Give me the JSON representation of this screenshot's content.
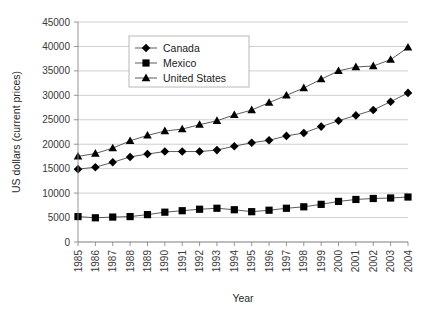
{
  "chart_data": {
    "type": "line",
    "title": "",
    "xlabel": "Year",
    "ylabel": "US dollars (current prices)",
    "x": [
      1985,
      1986,
      1987,
      1988,
      1989,
      1990,
      1991,
      1992,
      1993,
      1994,
      1995,
      1996,
      1997,
      1998,
      1999,
      2000,
      2001,
      2002,
      2003,
      2004
    ],
    "xtick_labels": [
      "1985",
      "1986",
      "1987",
      "1988",
      "1989",
      "1990",
      "1991",
      "1992",
      "1993",
      "1994",
      "1995",
      "1996",
      "1997",
      "1998",
      "1999",
      "2000",
      "2001",
      "2002",
      "2003",
      "2004"
    ],
    "ytick_labels": [
      "0",
      "5000",
      "10000",
      "15000",
      "20000",
      "25000",
      "30000",
      "35000",
      "40000",
      "45000"
    ],
    "ytick_values": [
      0,
      5000,
      10000,
      15000,
      20000,
      25000,
      30000,
      35000,
      40000,
      45000
    ],
    "ylim": [
      0,
      45000
    ],
    "xlim": [
      1985,
      2004
    ],
    "grid": "horizontal",
    "legend_position": "upper-left-inside",
    "series": [
      {
        "name": "Canada",
        "marker": "diamond",
        "color": "#000000",
        "values": [
          14900,
          15300,
          16300,
          17400,
          18000,
          18500,
          18500,
          18500,
          18800,
          19600,
          20300,
          20800,
          21700,
          22300,
          23600,
          24800,
          25900,
          27000,
          28700,
          30500
        ]
      },
      {
        "name": "Mexico",
        "marker": "square",
        "color": "#000000",
        "values": [
          5200,
          4950,
          5100,
          5200,
          5600,
          6100,
          6400,
          6700,
          6900,
          6600,
          6200,
          6500,
          6900,
          7200,
          7700,
          8300,
          8700,
          8900,
          9000,
          9200
        ]
      },
      {
        "name": "United States",
        "marker": "triangle",
        "color": "#000000",
        "values": [
          17500,
          18100,
          19200,
          20700,
          21800,
          22700,
          23100,
          24000,
          24800,
          26000,
          27000,
          28500,
          30000,
          31500,
          33300,
          35000,
          35800,
          36000,
          37300,
          39800
        ]
      }
    ]
  },
  "legend": {
    "entries": [
      {
        "label": "Canada",
        "marker": "diamond"
      },
      {
        "label": "Mexico",
        "marker": "square"
      },
      {
        "label": "United States",
        "marker": "triangle"
      }
    ]
  },
  "colors": {
    "background": "#ffffff",
    "gridline": "#c2c2c2",
    "axis": "#8a8a8a",
    "marker": "#000000",
    "line": "#4a4a4a",
    "text": "#1a1a1a"
  }
}
